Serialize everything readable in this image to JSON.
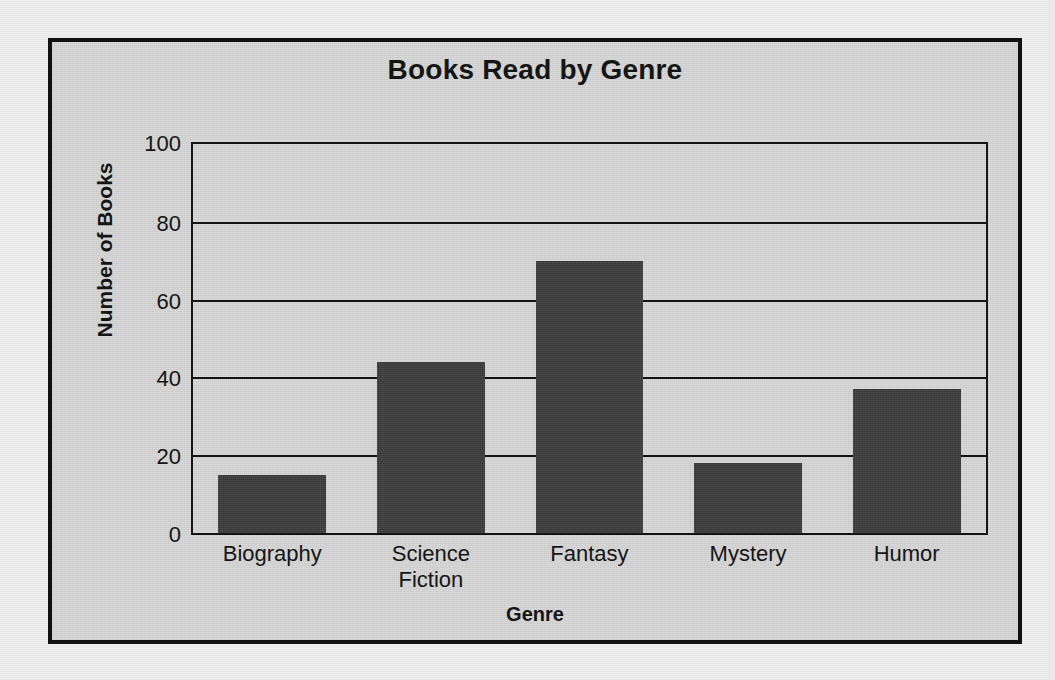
{
  "chart_data": {
    "type": "bar",
    "title": "Books Read by Genre",
    "xlabel": "Genre",
    "ylabel": "Number of Books",
    "categories": [
      "Biography",
      "Science Fiction",
      "Fantasy",
      "Mystery",
      "Humor"
    ],
    "category_lines": [
      [
        "Biography"
      ],
      [
        "Science",
        "Fiction"
      ],
      [
        "Fantasy"
      ],
      [
        "Mystery"
      ],
      [
        "Humor"
      ]
    ],
    "values": [
      15,
      44,
      70,
      18,
      37
    ],
    "ylim": [
      0,
      100
    ],
    "yticks": [
      0,
      20,
      40,
      60,
      80,
      100
    ],
    "ytick_labels": [
      "0",
      "20",
      "40",
      "60",
      "80",
      "100"
    ],
    "grid": true,
    "grid_axis": "y",
    "legend": false,
    "bar_color": "#3b3b3b",
    "axis_color": "#141414",
    "plot_background": "#d7d7d7",
    "figure_background": "#d7d7d7",
    "page_background": "#efefef"
  }
}
